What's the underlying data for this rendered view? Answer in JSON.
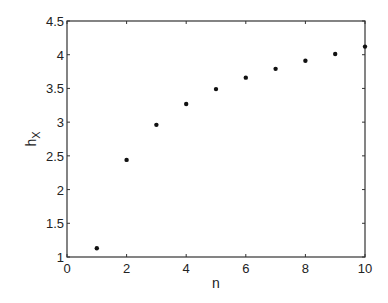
{
  "chart_data": {
    "type": "scatter",
    "title": "",
    "xlabel": "n",
    "ylabel": "h",
    "ylabel_subscript": "X",
    "xlim": [
      0,
      10
    ],
    "ylim": [
      1,
      4.5
    ],
    "grid": false,
    "legend": null,
    "x_ticks": [
      0,
      2,
      4,
      6,
      8,
      10
    ],
    "x_tick_labels": [
      "0",
      "2",
      "4",
      "6",
      "8",
      "10"
    ],
    "y_ticks": [
      1,
      1.5,
      2,
      2.5,
      3,
      3.5,
      4,
      4.5
    ],
    "y_tick_labels": [
      "1",
      "1.5",
      "2",
      "2.5",
      "3",
      "3.5",
      "4",
      "4.5"
    ],
    "series": [
      {
        "name": "h_X",
        "marker": "dot",
        "color": "#111111",
        "x": [
          1,
          2,
          3,
          4,
          5,
          6,
          7,
          8,
          9,
          10
        ],
        "y": [
          1.13,
          2.44,
          2.96,
          3.27,
          3.49,
          3.66,
          3.79,
          3.91,
          4.01,
          4.12
        ]
      }
    ]
  }
}
